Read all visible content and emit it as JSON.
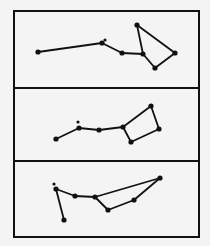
{
  "colors": {
    "background": "#f4f4f4",
    "ink": "#111111"
  },
  "frame": {
    "x": 14,
    "y": 11,
    "width": 185,
    "height": 226,
    "dividers": [
      88,
      161
    ]
  },
  "panels": [
    {
      "id": "panel-1",
      "points": [
        [
          38,
          52
        ],
        [
          102,
          43
        ],
        [
          122,
          53
        ],
        [
          143,
          54
        ],
        [
          137,
          25
        ],
        [
          175,
          53
        ],
        [
          155,
          68
        ]
      ],
      "edges": [
        [
          0,
          1
        ],
        [
          1,
          2
        ],
        [
          2,
          3
        ],
        [
          3,
          4
        ],
        [
          4,
          5
        ],
        [
          5,
          6
        ],
        [
          6,
          3
        ]
      ],
      "extra_dot": [
        105,
        40
      ]
    },
    {
      "id": "panel-2",
      "points": [
        [
          56,
          139
        ],
        [
          79,
          128
        ],
        [
          99,
          130
        ],
        [
          123,
          127
        ],
        [
          151,
          106
        ],
        [
          159,
          129
        ],
        [
          131,
          142
        ]
      ],
      "edges": [
        [
          0,
          1
        ],
        [
          1,
          2
        ],
        [
          2,
          3
        ],
        [
          3,
          4
        ],
        [
          4,
          5
        ],
        [
          5,
          6
        ],
        [
          6,
          3
        ]
      ],
      "extra_dot": [
        78,
        122
      ]
    },
    {
      "id": "panel-3",
      "points": [
        [
          64,
          220
        ],
        [
          56,
          189
        ],
        [
          75,
          196
        ],
        [
          95,
          197
        ],
        [
          160,
          178
        ],
        [
          134,
          200
        ],
        [
          108,
          210
        ]
      ],
      "edges": [
        [
          0,
          1
        ],
        [
          1,
          2
        ],
        [
          2,
          3
        ],
        [
          3,
          4
        ],
        [
          4,
          5
        ],
        [
          5,
          6
        ],
        [
          6,
          3
        ]
      ],
      "extra_dot": [
        54,
        184
      ]
    }
  ]
}
